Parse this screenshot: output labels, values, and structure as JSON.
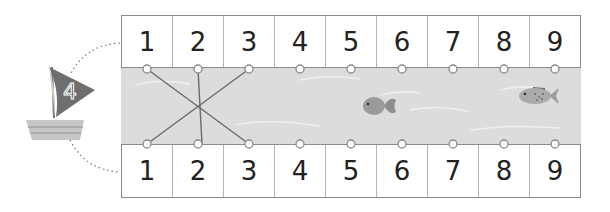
{
  "boat": {
    "sail_number": "4",
    "sail_color": "#6e6e6e",
    "hull_color": "#c4c4c4"
  },
  "top_row": {
    "numbers": [
      "1",
      "2",
      "3",
      "4",
      "5",
      "6",
      "7",
      "8",
      "9"
    ]
  },
  "bottom_row": {
    "numbers": [
      "1",
      "2",
      "3",
      "4",
      "5",
      "6",
      "7",
      "8",
      "9"
    ]
  },
  "river": {
    "color": "#dcdcdc",
    "fish": [
      {
        "name": "round-fish",
        "position": "under 5-6"
      },
      {
        "name": "spotted-fish",
        "position": "under 8-9"
      }
    ]
  },
  "connections": [
    {
      "from_top": "1",
      "to_bottom": "3"
    },
    {
      "from_top": "2",
      "to_bottom": "2"
    },
    {
      "from_top": "3",
      "to_bottom": "1"
    }
  ]
}
